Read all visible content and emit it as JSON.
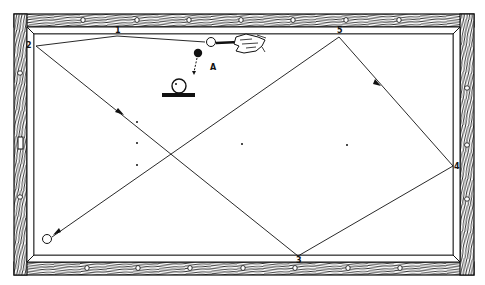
{
  "diagram": {
    "type": "billiards-shot-diagram",
    "colors": {
      "ink": "#111111",
      "paper": "#ffffff"
    },
    "rail_points": [
      {
        "label": "1",
        "x": 117,
        "y": 33
      },
      {
        "label": "2",
        "x": 30,
        "y": 46
      },
      {
        "label": "3",
        "x": 298,
        "y": 260
      },
      {
        "label": "4",
        "x": 456,
        "y": 166
      },
      {
        "label": "5",
        "x": 339,
        "y": 33
      }
    ],
    "inset": {
      "label": "A",
      "icon": "english-contact-point-icon",
      "note": "object ball struck, cue ball with contact dot on base"
    },
    "balls": {
      "cue_ball": {
        "x": 211,
        "y": 43,
        "color": "white"
      },
      "object_ball": {
        "x": 198,
        "y": 53,
        "color": "black"
      },
      "final_ball": {
        "x": 48,
        "y": 240,
        "color": "white"
      }
    },
    "path": [
      {
        "x": 211,
        "y": 43
      },
      {
        "x": 117,
        "y": 36
      },
      {
        "x": 36,
        "y": 46
      },
      {
        "x": 298,
        "y": 256
      },
      {
        "x": 453,
        "y": 166
      },
      {
        "x": 339,
        "y": 37
      },
      {
        "x": 52,
        "y": 237
      }
    ],
    "diamonds_top": [
      83,
      137,
      189,
      241,
      293,
      346,
      399
    ],
    "diamonds_bottom": [
      87,
      138,
      190,
      243,
      295,
      348,
      400
    ],
    "diamonds_left": [
      73,
      197
    ],
    "diamonds_right": [
      88,
      145,
      199
    ]
  }
}
